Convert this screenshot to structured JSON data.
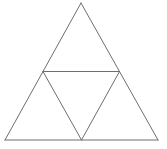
{
  "diagram": {
    "background": "#ffffff",
    "stroke_color": "#6e6e6e",
    "stroke_width": 1,
    "vertices": {
      "apex": [
        81,
        3
      ],
      "bottom_left": [
        5,
        140
      ],
      "bottom_right": [
        158,
        140
      ],
      "mid_left": [
        43,
        71.5
      ],
      "mid_right": [
        119.5,
        71.5
      ],
      "mid_bottom": [
        81.5,
        140
      ]
    },
    "segments": [
      {
        "name": "outer-left-edge",
        "from": "apex",
        "to": "bottom_left"
      },
      {
        "name": "outer-right-edge",
        "from": "apex",
        "to": "bottom_right"
      },
      {
        "name": "outer-bottom-edge",
        "from": "bottom_left",
        "to": "bottom_right"
      },
      {
        "name": "inner-top-edge",
        "from": "mid_left",
        "to": "mid_right"
      },
      {
        "name": "inner-left-edge",
        "from": "mid_left",
        "to": "mid_bottom"
      },
      {
        "name": "inner-right-edge",
        "from": "mid_right",
        "to": "mid_bottom"
      }
    ]
  }
}
